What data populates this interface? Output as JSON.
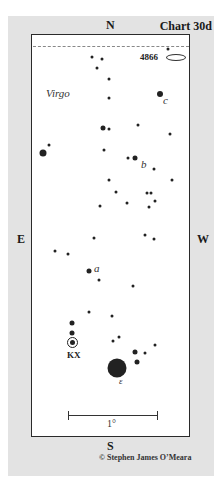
{
  "chart": {
    "title": "Chart 30d",
    "constellation": "Virgo",
    "directions": {
      "north": "N",
      "south": "S",
      "east": "E",
      "west": "W"
    },
    "galaxy_label": "4866",
    "variable_star_label": "KX",
    "star_labels": {
      "a": "a",
      "b": "b",
      "c": "c",
      "epsilon": "ε"
    },
    "scale_label": "1°",
    "copyright": "© Stephen James O’Meara"
  },
  "stars": [
    {
      "x": 92,
      "y": 57,
      "r": 3
    },
    {
      "x": 102,
      "y": 59,
      "r": 3
    },
    {
      "x": 97,
      "y": 68,
      "r": 3
    },
    {
      "x": 109,
      "y": 79,
      "r": 3
    },
    {
      "x": 109,
      "y": 98,
      "r": 3
    },
    {
      "x": 168,
      "y": 49,
      "r": 3
    },
    {
      "x": 160,
      "y": 94,
      "r": 6
    },
    {
      "x": 103,
      "y": 128,
      "r": 5
    },
    {
      "x": 109,
      "y": 129,
      "r": 3
    },
    {
      "x": 138,
      "y": 125,
      "r": 3
    },
    {
      "x": 170,
      "y": 134,
      "r": 3
    },
    {
      "x": 43,
      "y": 153,
      "r": 7
    },
    {
      "x": 49,
      "y": 145,
      "r": 3
    },
    {
      "x": 104,
      "y": 150,
      "r": 3
    },
    {
      "x": 128,
      "y": 158,
      "r": 3
    },
    {
      "x": 135,
      "y": 158,
      "r": 5
    },
    {
      "x": 154,
      "y": 169,
      "r": 3
    },
    {
      "x": 172,
      "y": 180,
      "r": 3
    },
    {
      "x": 109,
      "y": 180,
      "r": 3
    },
    {
      "x": 116,
      "y": 192,
      "r": 3
    },
    {
      "x": 147,
      "y": 193,
      "r": 3
    },
    {
      "x": 151,
      "y": 193,
      "r": 3
    },
    {
      "x": 155,
      "y": 201,
      "r": 3
    },
    {
      "x": 100,
      "y": 206,
      "r": 3
    },
    {
      "x": 127,
      "y": 203,
      "r": 3
    },
    {
      "x": 149,
      "y": 207,
      "r": 3
    },
    {
      "x": 94,
      "y": 238,
      "r": 3
    },
    {
      "x": 145,
      "y": 235,
      "r": 3
    },
    {
      "x": 154,
      "y": 239,
      "r": 3
    },
    {
      "x": 55,
      "y": 251,
      "r": 3
    },
    {
      "x": 68,
      "y": 254,
      "r": 3
    },
    {
      "x": 89,
      "y": 271,
      "r": 5
    },
    {
      "x": 99,
      "y": 280,
      "r": 3
    },
    {
      "x": 133,
      "y": 286,
      "r": 3
    },
    {
      "x": 89,
      "y": 312,
      "r": 3
    },
    {
      "x": 112,
      "y": 316,
      "r": 3
    },
    {
      "x": 72,
      "y": 323,
      "r": 5
    },
    {
      "x": 72,
      "y": 333,
      "r": 5
    },
    {
      "x": 119,
      "y": 337,
      "r": 3
    },
    {
      "x": 113,
      "y": 341,
      "r": 3
    },
    {
      "x": 155,
      "y": 345,
      "r": 3
    },
    {
      "x": 135,
      "y": 352,
      "r": 5
    },
    {
      "x": 145,
      "y": 353,
      "r": 3
    },
    {
      "x": 137,
      "y": 362,
      "r": 5
    },
    {
      "x": 117,
      "y": 368,
      "r": 19
    }
  ],
  "star_label_positions": [
    {
      "key": "c",
      "x": 163,
      "y": 100
    },
    {
      "key": "b",
      "x": 141,
      "y": 164
    },
    {
      "key": "a",
      "x": 94,
      "y": 268
    },
    {
      "key": "epsilon",
      "x": 119,
      "y": 381
    }
  ]
}
